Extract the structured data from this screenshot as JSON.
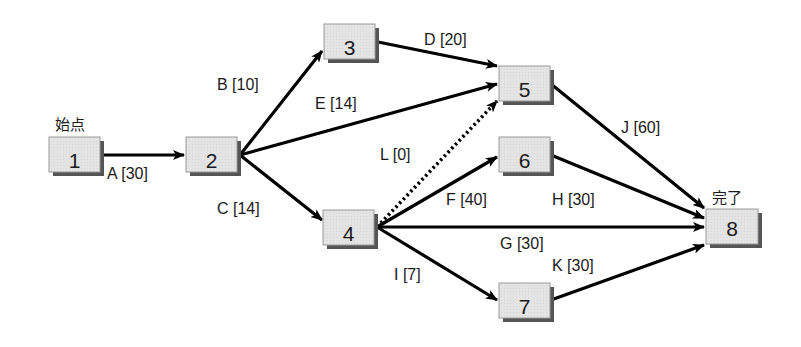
{
  "diagram": {
    "type": "activity-network (arrow diagram)",
    "start_label": "始点",
    "end_label": "完了",
    "colors": {
      "node_fill": "#e3e3e3",
      "node_border": "#9a9a9a",
      "node_shadow": "#555555",
      "edge": "#000000",
      "text": "#1a1a1a"
    },
    "nodes": [
      {
        "id": "1",
        "label": "1"
      },
      {
        "id": "2",
        "label": "2"
      },
      {
        "id": "3",
        "label": "3"
      },
      {
        "id": "4",
        "label": "4"
      },
      {
        "id": "5",
        "label": "5"
      },
      {
        "id": "6",
        "label": "6"
      },
      {
        "id": "7",
        "label": "7"
      },
      {
        "id": "8",
        "label": "8"
      }
    ],
    "edges": [
      {
        "activity": "A",
        "duration": 30,
        "from": "1",
        "to": "2",
        "label": "A [30]",
        "style": "solid"
      },
      {
        "activity": "B",
        "duration": 10,
        "from": "2",
        "to": "3",
        "label": "B [10]",
        "style": "solid"
      },
      {
        "activity": "C",
        "duration": 14,
        "from": "2",
        "to": "4",
        "label": "C [14]",
        "style": "solid"
      },
      {
        "activity": "D",
        "duration": 20,
        "from": "3",
        "to": "5",
        "label": "D [20]",
        "style": "solid"
      },
      {
        "activity": "E",
        "duration": 14,
        "from": "2",
        "to": "5",
        "label": "E [14]",
        "style": "solid"
      },
      {
        "activity": "F",
        "duration": 40,
        "from": "4",
        "to": "6",
        "label": "F [40]",
        "style": "solid"
      },
      {
        "activity": "G",
        "duration": 30,
        "from": "4",
        "to": "8",
        "label": "G [30]",
        "style": "solid"
      },
      {
        "activity": "H",
        "duration": 30,
        "from": "6",
        "to": "8",
        "label": "H [30]",
        "style": "solid"
      },
      {
        "activity": "I",
        "duration": 7,
        "from": "4",
        "to": "7",
        "label": "I [7]",
        "style": "solid"
      },
      {
        "activity": "J",
        "duration": 60,
        "from": "5",
        "to": "8",
        "label": "J [60]",
        "style": "solid"
      },
      {
        "activity": "K",
        "duration": 30,
        "from": "7",
        "to": "8",
        "label": "K [30]",
        "style": "solid"
      },
      {
        "activity": "L",
        "duration": 0,
        "from": "4",
        "to": "5",
        "label": "L [0]",
        "style": "dotted (dummy)"
      }
    ]
  }
}
